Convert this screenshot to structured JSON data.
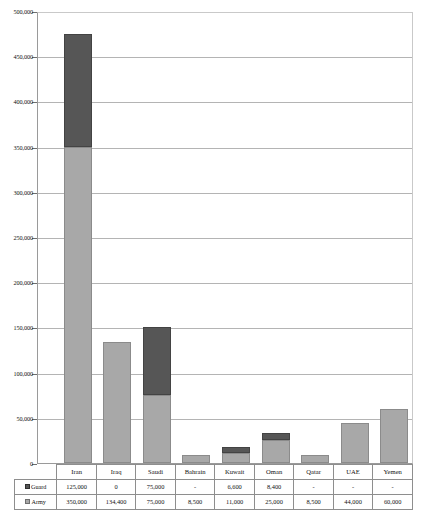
{
  "chart_data": {
    "type": "bar",
    "title": "",
    "subtitle": "",
    "xlabel": "",
    "ylabel": "",
    "stacked": true,
    "grid": true,
    "legend_position": "table-row-labels",
    "ylim": [
      0,
      500000
    ],
    "ytick_interval": 50000,
    "ytick_labels": [
      "500,000",
      "450,000",
      "400,000",
      "350,000",
      "300,000",
      "250,000",
      "200,000",
      "150,000",
      "100,000",
      "50,000",
      "0"
    ],
    "ytick_values": [
      500000,
      450000,
      400000,
      350000,
      300000,
      250000,
      200000,
      150000,
      100000,
      50000,
      0
    ],
    "categories": [
      "Iran",
      "Iraq",
      "Saudi",
      "Bahrain",
      "Kuwait",
      "Oman",
      "Qatar",
      "UAE",
      "Yemen"
    ],
    "series": [
      {
        "name": "Army",
        "color": "#a8a8a8",
        "values": [
          350000,
          134400,
          75000,
          8500,
          11000,
          25000,
          8500,
          44000,
          60000
        ],
        "labels": [
          "350,000",
          "134,400",
          "75,000",
          "8,500",
          "11,000",
          "25,000",
          "8,500",
          "44,000",
          "60,000"
        ]
      },
      {
        "name": "Guard",
        "color": "#565656",
        "values": [
          125000,
          0,
          75000,
          0,
          6600,
          8400,
          0,
          0,
          0
        ],
        "labels": [
          "125,000",
          "0",
          "75,000",
          "-",
          "6,600",
          "8,400",
          "-",
          "-",
          "-"
        ]
      }
    ],
    "totals": [
      475000,
      134400,
      150000,
      8500,
      17600,
      33400,
      8500,
      44000,
      60000
    ]
  },
  "table": {
    "header_row": {
      "corner_label": "",
      "columns": [
        "Iran",
        "Iraq",
        "Saudi",
        "Bahrain",
        "Kuwait",
        "Oman",
        "Qatar",
        "UAE",
        "Yemen"
      ]
    },
    "rows": [
      {
        "label": "Guard",
        "swatch": "guard-swatch-icon",
        "cells": [
          "125,000",
          "0",
          "75,000",
          "-",
          "6,600",
          "8,400",
          "-",
          "-",
          "-"
        ]
      },
      {
        "label": "Army",
        "swatch": "army-swatch-icon",
        "cells": [
          "350,000",
          "134,400",
          "75,000",
          "8,500",
          "11,000",
          "25,000",
          "8,500",
          "44,000",
          "60,000"
        ]
      }
    ]
  },
  "colors": {
    "army": "#a8a8a8",
    "guard": "#565656",
    "gridline": "#b4b4b4",
    "axis": "#9a9a9a",
    "plot_background": "#ffffff"
  }
}
